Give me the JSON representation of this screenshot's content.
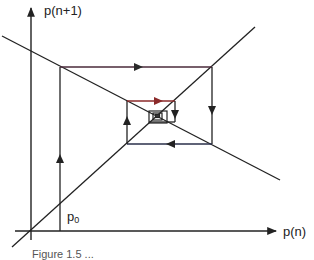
{
  "figure": {
    "type": "cobweb-diagram",
    "y_axis_label": "p(n+1)",
    "x_axis_label": "p(n)",
    "initial_point_label": "p",
    "initial_point_subscript": "0",
    "caption": "Figure 1.5 ...",
    "colors": {
      "line": "#222222",
      "cobweb_top": "#5a2a3a",
      "cobweb_red": "#8b2a2a",
      "cobweb_bottom": "#2a2f5a",
      "background": "#ffffff"
    }
  },
  "geometry": {
    "origin": [
      31,
      231
    ],
    "y_axis": {
      "from": [
        31,
        232
      ],
      "to": [
        31,
        5
      ]
    },
    "x_axis": {
      "from": [
        15,
        231
      ],
      "to": [
        278,
        231
      ]
    },
    "identity_line": {
      "from": [
        12,
        247
      ],
      "to": [
        255,
        27
      ]
    },
    "decreasing_line": {
      "from": [
        2,
        36
      ],
      "to": [
        280,
        180
      ]
    },
    "cobweb_path": [
      [
        60,
        231
      ],
      [
        60,
        67
      ],
      [
        212,
        67
      ],
      [
        212,
        144
      ],
      [
        127,
        144
      ],
      [
        127,
        101
      ],
      [
        175,
        101
      ],
      [
        175,
        122
      ],
      [
        149,
        122
      ],
      [
        149,
        111
      ],
      [
        167,
        111
      ],
      [
        167,
        123
      ]
    ],
    "inner_boxes": [
      {
        "x": 149,
        "y": 111,
        "w": 18,
        "h": 12
      },
      {
        "x": 153,
        "y": 113,
        "w": 9,
        "h": 7
      },
      {
        "x": 155,
        "y": 114,
        "w": 5,
        "h": 4
      }
    ],
    "arrows": [
      {
        "at": [
          60,
          160
        ],
        "dir": "up"
      },
      {
        "at": [
          135,
          67
        ],
        "dir": "right"
      },
      {
        "at": [
          212,
          110
        ],
        "dir": "down"
      },
      {
        "at": [
          172,
          144
        ],
        "dir": "left"
      },
      {
        "at": [
          127,
          124
        ],
        "dir": "up"
      },
      {
        "at": [
          158,
          101
        ],
        "dir": "right"
      },
      {
        "at": [
          175,
          114
        ],
        "dir": "down"
      }
    ]
  }
}
